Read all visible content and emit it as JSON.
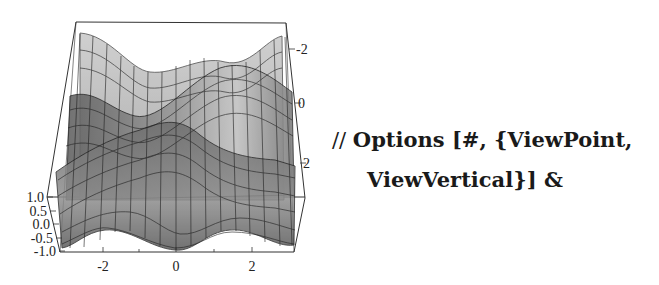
{
  "figure": {
    "type": "3D surface plot",
    "x_axis": {
      "ticks": [
        "-2",
        "0",
        "2"
      ]
    },
    "y_axis": {
      "ticks": [
        "-2",
        "0",
        "2"
      ]
    },
    "z_axis": {
      "ticks": [
        "1.0",
        "0.5",
        "0.0",
        "-0.5",
        "-1.0"
      ]
    }
  },
  "code": {
    "prefix": "//",
    "line1": "Options [#, {ViewPoint,",
    "line2": "ViewVertical}] &"
  }
}
